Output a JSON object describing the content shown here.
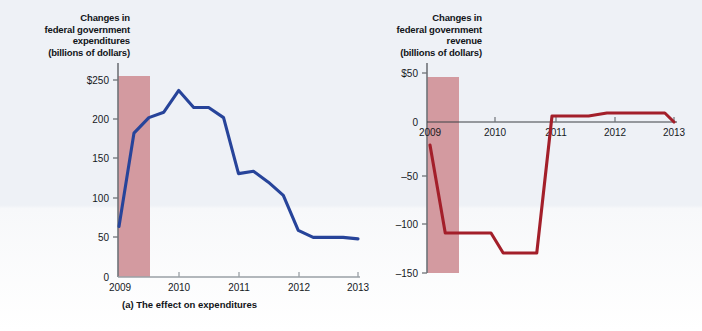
{
  "figure": {
    "background_color": "#eef1f6",
    "recession_band_color": "#d39aa0"
  },
  "panel_a": {
    "axis_title_lines": [
      "Changes in",
      "federal government",
      "expenditures",
      "(billions of dollars)"
    ],
    "caption": "(a) The effect on expenditures",
    "line_color": "#27449a",
    "chart_data": {
      "type": "line",
      "title": "Changes in federal government expenditures (billions of dollars)",
      "xlabel": "",
      "ylabel": "Changes in federal government expenditures (billions of dollars)",
      "x": [
        2009.0,
        2009.25,
        2009.5,
        2009.75,
        2010.0,
        2010.25,
        2010.5,
        2010.75,
        2011.0,
        2011.25,
        2011.5,
        2011.75,
        2012.0,
        2012.25,
        2012.5,
        2012.75,
        2013.0
      ],
      "values": [
        65,
        185,
        205,
        212,
        240,
        218,
        218,
        205,
        133,
        136,
        122,
        105,
        60,
        51,
        51,
        51,
        49
      ],
      "x_ticks": [
        2009,
        2010,
        2011,
        2012,
        2013
      ],
      "x_tick_labels": [
        "2009",
        "2010",
        "2011",
        "2012",
        "2013"
      ],
      "y_ticks": [
        0,
        50,
        100,
        150,
        200,
        250
      ],
      "y_tick_labels": [
        "0",
        "50",
        "100",
        "150",
        "200",
        "$250"
      ],
      "ylim": [
        0,
        265
      ],
      "xlim": [
        2009,
        2013
      ],
      "grid": false,
      "legend": "none",
      "shaded_region": {
        "label": "recession",
        "x_start": 2009.0,
        "x_end": 2009.5
      }
    }
  },
  "panel_b": {
    "axis_title_lines": [
      "Changes in",
      "federal government",
      "revenue",
      "(billions of dollars)"
    ],
    "caption": "(b) The effect on revenue",
    "line_color": "#a31f2a",
    "chart_data": {
      "type": "line",
      "title": "Changes in federal government revenue (billions of dollars)",
      "xlabel": "",
      "ylabel": "Changes in federal government revenue (billions of dollars)",
      "x": [
        2009.0,
        2009.25,
        2009.6,
        2010.0,
        2010.2,
        2010.75,
        2011.0,
        2011.6,
        2011.9,
        2012.6,
        2012.85,
        2013.0
      ],
      "values": [
        -22,
        -110,
        -110,
        -110,
        -130,
        -130,
        7,
        7,
        10,
        10,
        10,
        1
      ],
      "x_ticks": [
        2009,
        2010,
        2011,
        2012,
        2013
      ],
      "x_tick_labels": [
        "2009",
        "2010",
        "2011",
        "2012",
        "2013"
      ],
      "y_ticks": [
        50,
        0,
        -50,
        -100,
        -150
      ],
      "y_tick_labels": [
        "$50",
        "0",
        "–50",
        "–100",
        "–150"
      ],
      "ylim": [
        -150,
        50
      ],
      "xlim": [
        2009,
        2013
      ],
      "grid": false,
      "legend": "none",
      "zero_line": true,
      "shaded_region": {
        "label": "recession",
        "x_start": 2009.0,
        "x_end": 2009.5
      }
    }
  }
}
